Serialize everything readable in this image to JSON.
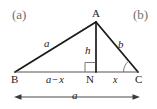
{
  "figure": {
    "type": "geometry-diagram",
    "panel_tags": {
      "left": "(a)",
      "right": "(b)"
    },
    "stroke_color": "#1b1b1b",
    "tag_color": "#6f6f6f",
    "background": "#ffffff",
    "vertices": {
      "A": {
        "label": "A",
        "x": 96,
        "y": 22
      },
      "B": {
        "label": "B",
        "x": 15,
        "y": 72
      },
      "C": {
        "label": "C",
        "x": 138,
        "y": 72
      },
      "N": {
        "label": "N",
        "x": 96,
        "y": 72
      }
    },
    "side_labels": {
      "ba": "a",
      "ac": "b",
      "altitude": "h"
    },
    "segment_labels": {
      "bn_left": "a",
      "bn_op": "−",
      "bn_right": "x",
      "nc": "x"
    },
    "dimension_arrow": {
      "label": "a",
      "from_x": 14,
      "to_x": 140,
      "y": 97,
      "double_headed": true
    },
    "markers": {
      "right_angle_at": "N",
      "angle_arc_at": "C"
    }
  }
}
